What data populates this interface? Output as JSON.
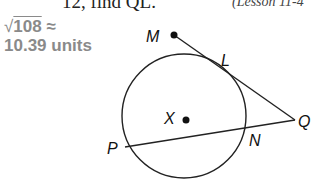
{
  "header": {
    "cut_text": "12, find QL.",
    "lesson_ref": "(Lesson 11-4"
  },
  "answer": {
    "line1_radical": "√",
    "line1_value": "108",
    "line1_approx": "≈",
    "line2": "10.39 units",
    "color": "#8a8a8a"
  },
  "diagram": {
    "circle": {
      "cx": 184,
      "cy": 116,
      "r": 62
    },
    "points": {
      "M": {
        "x": 174,
        "y": 35,
        "label": "M"
      },
      "L": {
        "x": 233,
        "y": 76,
        "label": "L"
      },
      "Q": {
        "x": 295,
        "y": 120,
        "label": "Q"
      },
      "X": {
        "x": 186,
        "y": 120,
        "label": "X"
      },
      "P": {
        "x": 125,
        "y": 147,
        "label": "P"
      },
      "N": {
        "x": 248,
        "y": 129,
        "label": "N"
      }
    },
    "segments": [
      "MQ (tangent through L)",
      "PQ (secant through N)"
    ]
  }
}
